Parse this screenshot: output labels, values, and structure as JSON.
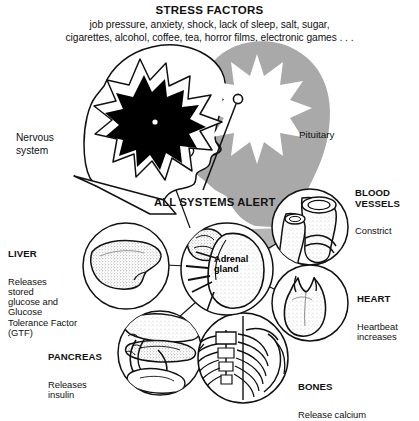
{
  "figure": {
    "title": "STRESS FACTORS",
    "subtitle_line1": "job pressure, anxiety, shock, lack of sleep, salt, sugar,",
    "subtitle_line2": "cigarettes, alcohol, coffee, tea, horror films, electronic games . . .",
    "center_caption": "ALL SYSTEMS ALERT",
    "colors": {
      "ink": "#111111",
      "paper": "#ffffff",
      "silhouette_gray": "#a9a9a9",
      "burst_black": "#000000",
      "burst_white": "#ffffff"
    }
  },
  "callouts": {
    "nervous_system": {
      "title": "Nervous\nsystem",
      "body": ""
    },
    "pituitary": {
      "title": "Pituitary",
      "body": ""
    },
    "adrenal_gland": {
      "title": "Adrenal\ngland",
      "body": ""
    },
    "liver": {
      "title": "LIVER",
      "body": "Releases\nstored\nglucose and\nGlucose\nTolerance Factor\n(GTF)"
    },
    "pancreas": {
      "title": "PANCREAS",
      "body": "Releases\ninsulin"
    },
    "blood_vessels": {
      "title": "BLOOD\nVESSELS",
      "body": "Constrict"
    },
    "heart": {
      "title": "HEART",
      "body": "Heartbeat\nincreases"
    },
    "bones": {
      "title": "BONES",
      "body": "Release calcium"
    }
  }
}
